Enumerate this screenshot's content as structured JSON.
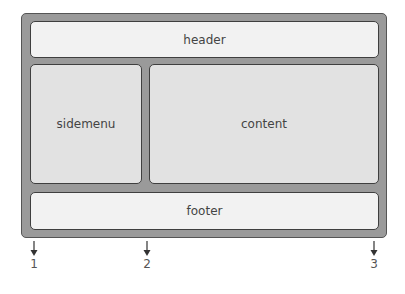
{
  "regions": {
    "header": "header",
    "sidemenu": "sidemenu",
    "content": "content",
    "footer": "footer"
  },
  "markers": [
    {
      "label": "1",
      "x": 34
    },
    {
      "label": "2",
      "x": 147
    },
    {
      "label": "3",
      "x": 374
    }
  ],
  "colors": {
    "frame": "#9a9a9a",
    "box_light": "#f2f2f2",
    "box_mid": "#e2e2e2",
    "border": "#3f3f3f"
  }
}
